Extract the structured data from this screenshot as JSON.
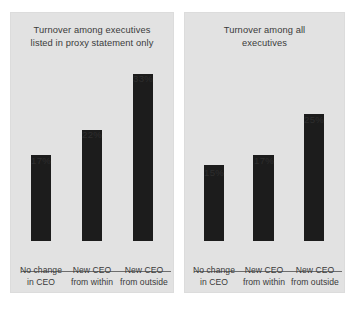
{
  "figure": {
    "background_color": "#ffffff",
    "panel_background_color": "#e2e2e2",
    "bar_color": "#1c1c1c",
    "axis_color": "#6d6d6d",
    "text_color": "#3a3a3a"
  },
  "chart_data": [
    {
      "type": "bar",
      "title": "Turnover among executives\nlisted in proxy statement only",
      "categories": [
        "No change\nin CEO",
        "New CEO\nfrom within",
        "New CEO\nfrom outside"
      ],
      "values": [
        17,
        22,
        33
      ],
      "value_labels": [
        "17%",
        "22%",
        "33%"
      ],
      "xlabel": "",
      "ylabel": "",
      "ylim": [
        0,
        40
      ],
      "grid": false,
      "legend": false,
      "units": "percent"
    },
    {
      "type": "bar",
      "title": "Turnover among all\nexecutives",
      "categories": [
        "No change\nin CEO",
        "New CEO\nfrom within",
        "New CEO\nfrom outside"
      ],
      "values": [
        15,
        17,
        25
      ],
      "value_labels": [
        "15%",
        "17%",
        "25%"
      ],
      "xlabel": "",
      "ylabel": "",
      "ylim": [
        0,
        40
      ],
      "grid": false,
      "legend": false,
      "units": "percent"
    }
  ]
}
